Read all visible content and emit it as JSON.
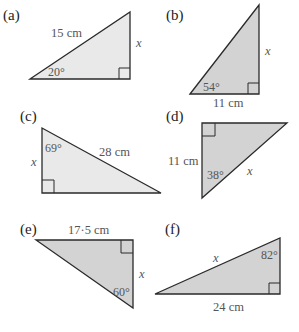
{
  "figure": {
    "colors": {
      "light_fill": "#e9e9e9",
      "dark_fill": "#d3d3d3",
      "stroke": "#2a2a2a",
      "text": "#555555"
    },
    "triangles": [
      {
        "label": "(a)",
        "hypotenuse": "15 cm",
        "unknown": "x",
        "angle": "20°",
        "unknown_side": "opposite"
      },
      {
        "label": "(b)",
        "adjacent": "11 cm",
        "unknown": "x",
        "angle": "54°",
        "unknown_side": "opposite"
      },
      {
        "label": "(c)",
        "hypotenuse": "28 cm",
        "unknown": "x",
        "angle": "69°",
        "unknown_side": "adjacent"
      },
      {
        "label": "(d)",
        "adjacent": "11 cm",
        "unknown": "x",
        "angle": "38°",
        "unknown_side": "hypotenuse"
      },
      {
        "label": "(e)",
        "opposite": "17·5 cm",
        "unknown": "x",
        "angle": "60°",
        "unknown_side": "adjacent"
      },
      {
        "label": "(f)",
        "opposite": "24 cm",
        "unknown": "x",
        "angle": "82°",
        "unknown_side": "hypotenuse"
      }
    ]
  }
}
